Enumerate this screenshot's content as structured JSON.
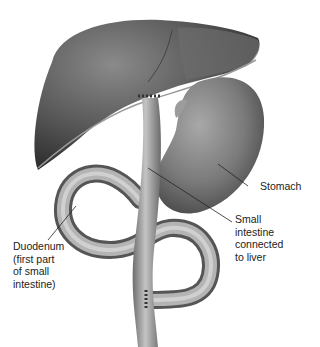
{
  "diagram": {
    "type": "anatomical-illustration",
    "organs": [
      "liver",
      "stomach",
      "small-intestine",
      "duodenum"
    ],
    "labels": {
      "stomach": "Stomach",
      "small_intestine": "Small\nintestine\nconnected\nto liver",
      "duodenum": "Duodenum\n(first part\nof small\nintestine)"
    }
  }
}
